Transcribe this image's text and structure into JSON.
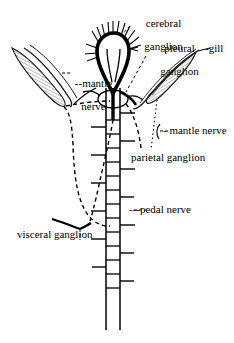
{
  "figure": {
    "background_color": "#ffffff",
    "ink_color": "#000000",
    "gill_shading_color": "#8d8d8d",
    "width": 234,
    "height": 343
  },
  "labels": {
    "cerebral_ganglion": "cerebral\nganglion",
    "pleural_ganglion": "pleural\nganglion",
    "gill": "gill",
    "mantle_nerve_left": "--mantle\n  nerve",
    "mantle_nerve_right": "-- mantle nerve",
    "parietal_ganglion": "parietal ganglion",
    "pedal_nerve": "---pedal nerve",
    "visceral_ganglion": "visceral ganglion"
  },
  "label_text": {
    "cerebral_ganglion_line1": "cerebral",
    "cerebral_ganglion_line2": "ganglion",
    "pleural_ganglion_line1": "pleural",
    "pleural_ganglion_line2": "ganglion",
    "gill": "-gill",
    "mantle_nerve_left_line1": "--mantle",
    "mantle_nerve_left_line2": "nerve",
    "mantle_nerve_right": "- mantle nerve",
    "parietal_ganglion": "parietal ganglion",
    "pedal_nerve": "---pedal nerve",
    "visceral_ganglion": "visceral ganglion"
  },
  "anatomy": {
    "structures": [
      "cerebral ganglion",
      "pleural ganglion",
      "parietal ganglion",
      "visceral ganglion",
      "pedal nerve",
      "mantle nerve",
      "gill"
    ],
    "nerve_cord_segments": 14,
    "cerebral_bristle_count": 11
  }
}
